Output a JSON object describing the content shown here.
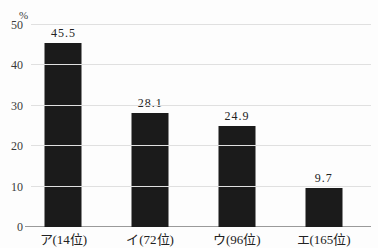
{
  "chart_data": {
    "type": "bar",
    "title": "",
    "xlabel": "",
    "ylabel": "%",
    "categories": [
      "ア(14位)",
      "イ(72位)",
      "ウ(96位)",
      "エ(165位)"
    ],
    "values": [
      45.5,
      28.1,
      24.9,
      9.7
    ],
    "value_labels": [
      "45.5",
      "28.1",
      "24.9",
      "9.7"
    ],
    "y_ticks": [
      0,
      10,
      20,
      30,
      40,
      50
    ],
    "ylim": [
      0,
      50
    ],
    "grid": true,
    "legend": "none",
    "bar_color": "#1b1b1b",
    "gridline_color": "#e0e0e0",
    "axis_line_color": "#9a9a9a",
    "text_color": "#2b2b2b",
    "background_color": "#fdfdfd"
  }
}
